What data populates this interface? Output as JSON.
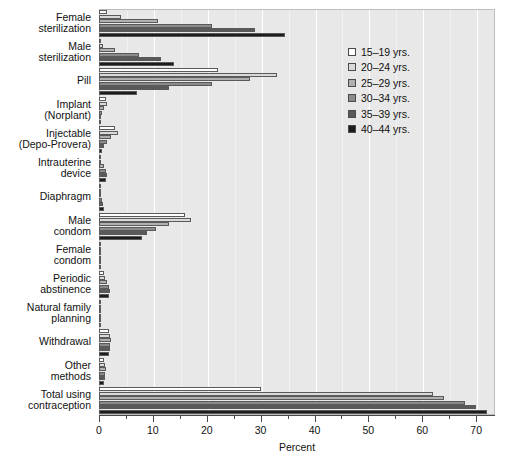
{
  "chart_data": {
    "type": "bar",
    "orientation": "horizontal",
    "title": "",
    "xlabel": "Percent",
    "ylabel": "",
    "xlim": [
      0,
      73.5
    ],
    "xticks": [
      0,
      10,
      20,
      30,
      40,
      50,
      60,
      70
    ],
    "xtick_labels": [
      "0",
      "10",
      "20",
      "30",
      "40",
      "50",
      "60",
      "70"
    ],
    "minor_xticks": [
      5,
      15,
      25,
      35,
      45,
      55,
      65
    ],
    "grid": true,
    "legend_position": "upper right",
    "categories": [
      "Female sterilization",
      "Male sterilization",
      "Pill",
      "Implant (Norplant)",
      "Injectable (Depo-Provera)",
      "Intrauterine device",
      "Diaphragm",
      "Male condom",
      "Female condom",
      "Periodic abstinence",
      "Natural family planning",
      "Withdrawal",
      "Other methods",
      "Total using contraception"
    ],
    "category_lines": [
      [
        "Female",
        "sterilization"
      ],
      [
        "Male",
        "sterilization"
      ],
      [
        "Pill"
      ],
      [
        "Implant",
        "(Norplant)"
      ],
      [
        "Injectable",
        "(Depo-Provera)"
      ],
      [
        "Intrauterine",
        "device"
      ],
      [
        "Diaphragm"
      ],
      [
        "Male",
        "condom"
      ],
      [
        "Female",
        "condom"
      ],
      [
        "Periodic",
        "abstinence"
      ],
      [
        "Natural family",
        "planning"
      ],
      [
        "Withdrawal"
      ],
      [
        "Other",
        "methods"
      ],
      [
        "Total using",
        "contraception"
      ]
    ],
    "series": [
      {
        "name": "15–19 yrs.",
        "color": "#ffffff",
        "values": [
          1.5,
          0.3,
          22.0,
          1.3,
          3.0,
          0.2,
          0.1,
          16.0,
          0.3,
          1.0,
          0.2,
          1.8,
          1.0,
          30.0
        ]
      },
      {
        "name": "20–24 yrs.",
        "color": "#d9d9d9",
        "values": [
          4.0,
          0.8,
          33.0,
          1.5,
          3.5,
          0.4,
          0.2,
          17.0,
          0.3,
          1.2,
          0.3,
          2.0,
          1.2,
          62.0
        ]
      },
      {
        "name": "25–29 yrs.",
        "color": "#b0b0b0",
        "values": [
          11.0,
          3.0,
          28.0,
          0.9,
          2.2,
          1.0,
          0.3,
          13.0,
          0.2,
          1.5,
          0.3,
          2.2,
          1.3,
          64.0
        ]
      },
      {
        "name": "30–34 yrs.",
        "color": "#8a8a8a",
        "values": [
          21.0,
          7.5,
          21.0,
          0.5,
          1.5,
          1.3,
          0.6,
          10.5,
          0.2,
          1.8,
          0.4,
          2.1,
          1.2,
          68.0
        ]
      },
      {
        "name": "35–39 yrs.",
        "color": "#595959",
        "values": [
          29.0,
          11.5,
          13.0,
          0.2,
          1.0,
          1.4,
          0.8,
          9.0,
          0.2,
          2.0,
          0.4,
          2.0,
          1.1,
          70.0
        ]
      },
      {
        "name": "40–44 yrs.",
        "color": "#1c1c1c",
        "values": [
          34.5,
          14.0,
          7.0,
          0.1,
          0.6,
          1.3,
          0.9,
          8.0,
          0.1,
          1.8,
          0.3,
          1.8,
          1.0,
          72.0
        ]
      }
    ]
  },
  "legend": {
    "items": [
      {
        "label": "15–19 yrs.",
        "color": "#ffffff"
      },
      {
        "label": "20–24 yrs.",
        "color": "#d9d9d9"
      },
      {
        "label": "25–29 yrs.",
        "color": "#b0b0b0"
      },
      {
        "label": "30–34 yrs.",
        "color": "#8a8a8a"
      },
      {
        "label": "35–39 yrs.",
        "color": "#595959"
      },
      {
        "label": "40–44 yrs.",
        "color": "#1c1c1c"
      }
    ]
  },
  "axis": {
    "x_title": "Percent"
  },
  "colors": {
    "plot_background": "#e8e8e8",
    "gridline": "#ffffff",
    "axis": "#4a4a4a",
    "text": "#111111"
  }
}
